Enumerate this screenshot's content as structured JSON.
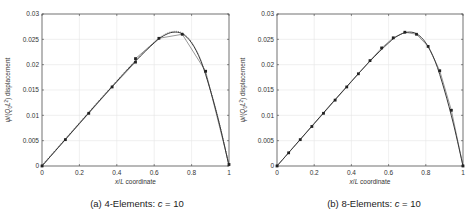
{
  "chart_data": [
    {
      "type": "line",
      "title": "(a) 4-Elements: c = 10",
      "caption_prefix": "(a) 4-Elements: ",
      "caption_var": "c",
      "caption_suffix": " = 10",
      "xlabel": "x/L coordinate",
      "ylabel": "ψ/(Q0 L²) displacement",
      "xlim": [
        0,
        1
      ],
      "ylim": [
        0,
        0.03
      ],
      "xticks": [
        "0",
        "0.2",
        "0.4",
        "0.6",
        "0.8",
        "1"
      ],
      "yticks": [
        "0",
        "0.005",
        "0.01",
        "0.015",
        "0.02",
        "0.025",
        "0.03"
      ],
      "grid": true,
      "series": [
        {
          "name": "exact",
          "style": "solid",
          "x": [
            0,
            0.1,
            0.2,
            0.3,
            0.4,
            0.5,
            0.6,
            0.65,
            0.7,
            0.75,
            0.8,
            0.85,
            0.9,
            0.95,
            1.0
          ],
          "y": [
            0,
            0.0042,
            0.0084,
            0.0126,
            0.0167,
            0.0207,
            0.0243,
            0.0257,
            0.0264,
            0.0261,
            0.0243,
            0.0207,
            0.015,
            0.0081,
            0
          ]
        },
        {
          "name": "FE nodes",
          "style": "markers",
          "x": [
            0,
            0.125,
            0.25,
            0.375,
            0.5,
            0.5,
            0.625,
            0.75,
            0.875,
            1.0
          ],
          "y": [
            0,
            0.0052,
            0.0104,
            0.0156,
            0.0205,
            0.0212,
            0.0252,
            0.026,
            0.0187,
            0.0003
          ]
        }
      ]
    },
    {
      "type": "line",
      "title": "(b) 8-Elements: c = 10",
      "caption_prefix": "(b) 8-Elements: ",
      "caption_var": "c",
      "caption_suffix": " = 10",
      "xlabel": "x/L coordinate",
      "ylabel": "ψ/(Q0 L²) displacement",
      "xlim": [
        0,
        1
      ],
      "ylim": [
        0,
        0.03
      ],
      "xticks": [
        "0",
        "0.2",
        "0.4",
        "0.6",
        "0.8",
        "1"
      ],
      "yticks": [
        "0",
        "0.005",
        "0.01",
        "0.015",
        "0.02",
        "0.025",
        "0.03"
      ],
      "grid": true,
      "series": [
        {
          "name": "exact",
          "style": "solid",
          "x": [
            0,
            0.1,
            0.2,
            0.3,
            0.4,
            0.5,
            0.6,
            0.65,
            0.7,
            0.75,
            0.8,
            0.85,
            0.9,
            0.95,
            1.0
          ],
          "y": [
            0,
            0.0042,
            0.0084,
            0.0126,
            0.0167,
            0.0207,
            0.0243,
            0.0257,
            0.0264,
            0.0261,
            0.0243,
            0.0207,
            0.015,
            0.0081,
            0
          ]
        },
        {
          "name": "FE nodes",
          "style": "markers",
          "x": [
            0,
            0.0625,
            0.125,
            0.1875,
            0.25,
            0.3125,
            0.375,
            0.4375,
            0.5,
            0.5625,
            0.625,
            0.6875,
            0.75,
            0.8125,
            0.875,
            0.9375,
            1.0
          ],
          "y": [
            0,
            0.0026,
            0.0052,
            0.0078,
            0.0104,
            0.013,
            0.0156,
            0.0182,
            0.0208,
            0.0233,
            0.0253,
            0.0264,
            0.026,
            0.0236,
            0.0188,
            0.011,
            0
          ]
        }
      ]
    }
  ]
}
